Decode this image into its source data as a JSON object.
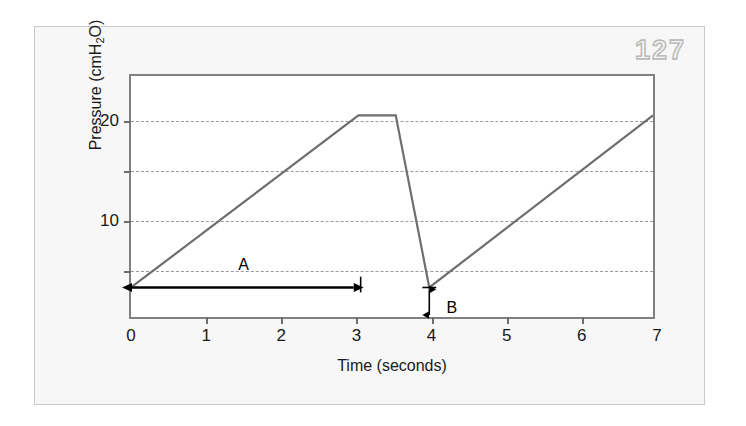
{
  "page": {
    "number": "127"
  },
  "chart_data": {
    "type": "line",
    "title": "",
    "xlabel": "Time (seconds)",
    "ylabel": "Pressure (cmH2O)",
    "ylabel_parts": {
      "prefix": "Pressure (cmH",
      "sub": "2",
      "suffix": "O)"
    },
    "xlim": [
      0,
      7
    ],
    "ylim": [
      0,
      24.5
    ],
    "grid": true,
    "grid_axis": "y",
    "grid_style": "dashed",
    "legend": "none",
    "x_ticks": [
      {
        "value": 0,
        "label": "0"
      },
      {
        "value": 1,
        "label": "1"
      },
      {
        "value": 2,
        "label": "2"
      },
      {
        "value": 3,
        "label": "3"
      },
      {
        "value": 4,
        "label": "4"
      },
      {
        "value": 5,
        "label": "5"
      },
      {
        "value": 6,
        "label": "6"
      },
      {
        "value": 7,
        "label": "7"
      }
    ],
    "y_ticks": [
      {
        "value": 5,
        "label": ""
      },
      {
        "value": 10,
        "label": "10"
      },
      {
        "value": 15,
        "label": ""
      },
      {
        "value": 20,
        "label": "20"
      }
    ],
    "gridline_values": [
      5,
      10,
      15,
      20
    ],
    "series": [
      {
        "name": "Airway pressure",
        "color": "#6e6e6e",
        "points": [
          {
            "x": 0.0,
            "y": 3.0
          },
          {
            "x": 3.05,
            "y": 20.5
          },
          {
            "x": 3.55,
            "y": 20.5
          },
          {
            "x": 4.0,
            "y": 3.0
          },
          {
            "x": 7.0,
            "y": 20.5
          }
        ]
      }
    ],
    "annotations": [
      {
        "id": "A",
        "label": "A",
        "type": "double-arrow-horizontal",
        "x_start": 0.0,
        "x_end": 3.0,
        "y": 3.0,
        "label_x": 1.5,
        "label_y": 5.6,
        "end_tick": true,
        "description": "Inspiratory time interval"
      },
      {
        "id": "B",
        "label": "B",
        "type": "double-arrow-vertical",
        "x": 4.0,
        "y_start": 3.0,
        "y_end": 0.0,
        "label_x": 4.2,
        "label_y": 2.2,
        "description": "Baseline PEEP level"
      }
    ]
  }
}
